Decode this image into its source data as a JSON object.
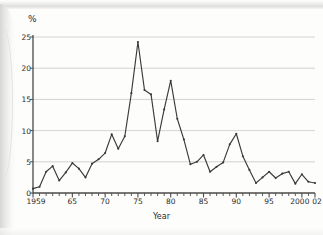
{
  "chart_data": {
    "type": "line",
    "title": "",
    "xlabel": "Year",
    "ylabel": "%",
    "ylim": [
      0,
      25
    ],
    "xlim": [
      1959,
      2002
    ],
    "grid": true,
    "legend": "none",
    "y_ticks": [
      0,
      5,
      10,
      15,
      20,
      25
    ],
    "y_tick_labels": [
      "0",
      "5",
      "10",
      "15",
      "20",
      "25"
    ],
    "x_ticks": [
      1959,
      1965,
      1970,
      1975,
      1980,
      1985,
      1990,
      1995,
      2000,
      2002
    ],
    "x_tick_labels": [
      "1959",
      "65",
      "70",
      "75",
      "80",
      "85",
      "90",
      "95",
      "2000",
      "02"
    ],
    "x_minor_tick_step": 1,
    "line_color": "#3a3a3a",
    "marker": "dot",
    "x": [
      1959,
      1960,
      1961,
      1962,
      1963,
      1964,
      1965,
      1966,
      1967,
      1968,
      1969,
      1970,
      1971,
      1972,
      1973,
      1974,
      1975,
      1976,
      1977,
      1978,
      1979,
      1980,
      1981,
      1982,
      1983,
      1984,
      1985,
      1986,
      1987,
      1988,
      1989,
      1990,
      1991,
      1992,
      1993,
      1994,
      1995,
      1996,
      1997,
      1998,
      1999,
      2000,
      2001,
      2002
    ],
    "values": [
      0.7,
      1.0,
      3.4,
      4.3,
      2.0,
      3.3,
      4.8,
      3.9,
      2.5,
      4.7,
      5.4,
      6.4,
      9.4,
      7.1,
      9.1,
      16.0,
      24.2,
      16.5,
      15.8,
      8.3,
      13.4,
      18.0,
      11.9,
      8.6,
      4.6,
      5.0,
      6.1,
      3.4,
      4.2,
      4.9,
      7.8,
      9.5,
      5.9,
      3.7,
      1.6,
      2.5,
      3.4,
      2.4,
      3.1,
      3.4,
      1.5,
      3.0,
      1.8,
      1.6
    ],
    "series_name": "Annual percentage change"
  },
  "labels": {
    "y_axis_title": "%",
    "x_axis_title": "Year"
  }
}
